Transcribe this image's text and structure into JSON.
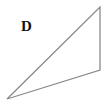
{
  "diagram": {
    "type": "triangle",
    "label": "D",
    "vertices": [
      {
        "name": "top",
        "x": 100,
        "y": 7
      },
      {
        "name": "bottom-right",
        "x": 100,
        "y": 70
      },
      {
        "name": "bottom-left",
        "x": 7,
        "y": 99
      }
    ],
    "stroke_color": "#8a8a8a",
    "stroke_width": 1.3,
    "fill_color": "#ffffff"
  }
}
